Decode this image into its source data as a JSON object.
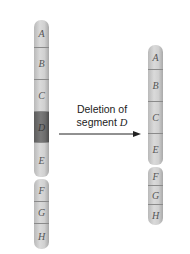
{
  "diagram": {
    "caption": {
      "line1": "Deletion of",
      "line2_prefix": "segment ",
      "line2_var": "D"
    },
    "colors": {
      "segment": "#cfcfcf",
      "deleted_segment": "#6a6a6a",
      "arrow": "#222222"
    },
    "before": {
      "segments": [
        {
          "label": "A",
          "highlight": false
        },
        {
          "label": "B",
          "highlight": false
        },
        {
          "label": "C",
          "highlight": false
        },
        {
          "label": "D",
          "highlight": true
        },
        {
          "label": "E",
          "highlight": false
        },
        {
          "label": "F",
          "highlight": false
        },
        {
          "label": "G",
          "highlight": false
        },
        {
          "label": "H",
          "highlight": false
        }
      ]
    },
    "after": {
      "segments": [
        {
          "label": "A"
        },
        {
          "label": "B"
        },
        {
          "label": "C"
        },
        {
          "label": "E"
        },
        {
          "label": "F"
        },
        {
          "label": "G"
        },
        {
          "label": "H"
        }
      ]
    }
  }
}
